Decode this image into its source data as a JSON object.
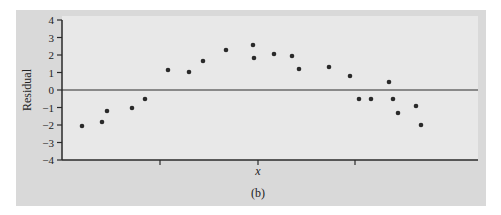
{
  "chart_data": {
    "type": "scatter",
    "title": "",
    "panel_label": "(b)",
    "xlabel": "x",
    "ylabel": "Residual",
    "ylim": [
      -4,
      4
    ],
    "yticks": [
      4,
      3,
      2,
      1,
      0,
      -1,
      -2,
      -3,
      -4
    ],
    "ytick_labels": [
      "4",
      "3",
      "2",
      "1",
      "0",
      "−1",
      "−2",
      "−3",
      "−4"
    ],
    "xticks_unlabeled": 3,
    "reference_line": 0,
    "grid": false,
    "legend": null,
    "points": [
      {
        "x": 82,
        "y": -2.06
      },
      {
        "x": 102,
        "y": -1.83
      },
      {
        "x": 107,
        "y": -1.2
      },
      {
        "x": 132,
        "y": -1.03
      },
      {
        "x": 145,
        "y": -0.51
      },
      {
        "x": 168,
        "y": 1.14
      },
      {
        "x": 189,
        "y": 1.03
      },
      {
        "x": 203,
        "y": 1.66
      },
      {
        "x": 226,
        "y": 2.29
      },
      {
        "x": 253,
        "y": 2.57
      },
      {
        "x": 254,
        "y": 1.83
      },
      {
        "x": 274,
        "y": 2.06
      },
      {
        "x": 292,
        "y": 1.94
      },
      {
        "x": 299,
        "y": 1.2
      },
      {
        "x": 329,
        "y": 1.31
      },
      {
        "x": 350,
        "y": 0.8
      },
      {
        "x": 359,
        "y": -0.51
      },
      {
        "x": 371,
        "y": -0.51
      },
      {
        "x": 389,
        "y": 0.46
      },
      {
        "x": 393,
        "y": -0.51
      },
      {
        "x": 398,
        "y": -1.31
      },
      {
        "x": 416,
        "y": -0.91
      },
      {
        "x": 421,
        "y": -2.0
      }
    ]
  },
  "colors": {
    "panel_bg": "#d9d9d9",
    "plot_bg": "#e8e8e8",
    "axis": "#2a2a2a",
    "point": "#2a2a2a"
  }
}
